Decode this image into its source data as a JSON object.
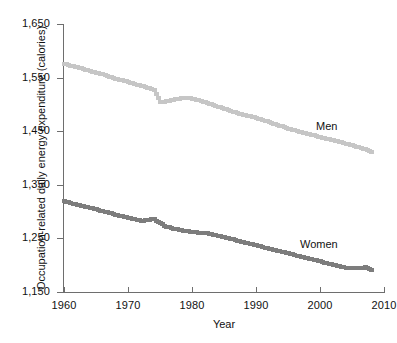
{
  "chart_data": {
    "type": "scatter",
    "title": "",
    "xlabel": "Year",
    "ylabel": "Occupation-related daily energy expenditure (calories)",
    "xlim": [
      1960,
      2010
    ],
    "ylim": [
      1150,
      1650
    ],
    "xticks": [
      1960,
      1970,
      1980,
      1990,
      2000,
      2010
    ],
    "xticklabels": [
      "1960",
      "1970",
      "1980",
      "1990",
      "2000",
      "2010"
    ],
    "yticks": [
      1150,
      1250,
      1350,
      1450,
      1550,
      1650
    ],
    "yticklabels": [
      "1,150",
      "1,250",
      "1,350",
      "1,450",
      "1,550",
      "1,650"
    ],
    "grid": false,
    "legend_position": "inline-annotation",
    "series": [
      {
        "name": "Men",
        "color": "#c6c6c6",
        "label_x": 2002,
        "label_y": 1468,
        "x": [
          1960,
          1961,
          1962,
          1963,
          1964,
          1965,
          1966,
          1967,
          1968,
          1969,
          1970,
          1971,
          1972,
          1973,
          1974,
          1975,
          1976,
          1977,
          1978,
          1979,
          1980,
          1981,
          1982,
          1983,
          1984,
          1985,
          1986,
          1987,
          1988,
          1989,
          1990,
          1991,
          1992,
          1993,
          1994,
          1995,
          1996,
          1997,
          1998,
          1999,
          2000,
          2001,
          2002,
          2003,
          2004,
          2005,
          2006,
          2007,
          2008
        ],
        "values": [
          1576,
          1572,
          1569,
          1566,
          1562,
          1559,
          1556,
          1552,
          1548,
          1545,
          1542,
          1538,
          1535,
          1531,
          1527,
          1504,
          1506,
          1509,
          1511,
          1512,
          1511,
          1508,
          1504,
          1500,
          1496,
          1492,
          1488,
          1484,
          1481,
          1478,
          1475,
          1471,
          1467,
          1463,
          1459,
          1455,
          1452,
          1448,
          1445,
          1442,
          1439,
          1436,
          1433,
          1430,
          1427,
          1424,
          1420,
          1416,
          1412
        ]
      },
      {
        "name": "Women",
        "color": "#7d7d7d",
        "label_x": 1997,
        "label_y": 1254,
        "x": [
          1960,
          1961,
          1962,
          1963,
          1964,
          1965,
          1966,
          1967,
          1968,
          1969,
          1970,
          1971,
          1972,
          1973,
          1974,
          1975,
          1976,
          1977,
          1978,
          1979,
          1980,
          1981,
          1982,
          1983,
          1984,
          1985,
          1986,
          1987,
          1988,
          1989,
          1990,
          1991,
          1992,
          1993,
          1994,
          1995,
          1996,
          1997,
          1998,
          1999,
          2000,
          2001,
          2002,
          2003,
          2004,
          2005,
          2006,
          2007,
          2008
        ],
        "values": [
          1319,
          1316,
          1313,
          1310,
          1307,
          1304,
          1301,
          1298,
          1294,
          1291,
          1288,
          1286,
          1283,
          1284,
          1286,
          1278,
          1272,
          1268,
          1266,
          1264,
          1262,
          1261,
          1260,
          1258,
          1255,
          1252,
          1249,
          1246,
          1243,
          1240,
          1237,
          1234,
          1231,
          1228,
          1225,
          1222,
          1219,
          1216,
          1213,
          1210,
          1207,
          1204,
          1201,
          1198,
          1195,
          1194,
          1195,
          1196,
          1191
        ]
      }
    ]
  },
  "annotations": {
    "men_label": "Men",
    "women_label": "Women"
  }
}
